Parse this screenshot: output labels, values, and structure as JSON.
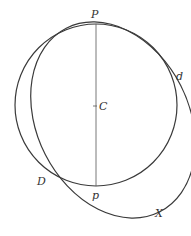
{
  "figure": {
    "labels": {
      "P": "P",
      "C": "C",
      "d": "d",
      "D": "D",
      "p": "p",
      "X": "X"
    },
    "colors": {
      "stroke": "#3a3a3a",
      "text": "#333333",
      "background": "#ffffff"
    },
    "elements": {
      "circle": {
        "center": "C",
        "top": "P",
        "bottom": "p"
      },
      "ellipse": {
        "passes_through": [
          "P",
          "d",
          "D",
          "X"
        ]
      },
      "diameter": {
        "from": "P",
        "to": "p",
        "through": "C"
      }
    }
  }
}
